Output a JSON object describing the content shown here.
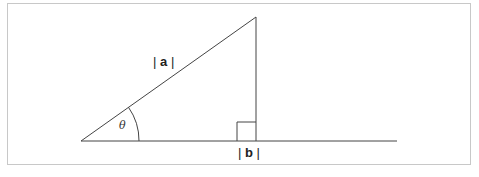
{
  "diagram": {
    "type": "right-triangle-vector-projection",
    "labels": {
      "hypotenuse": "| a |",
      "hypotenuse_bar_left": "|",
      "hypotenuse_var": "a",
      "hypotenuse_bar_right": "|",
      "base_bar_left": "|",
      "base_var": "b",
      "base_bar_right": "|",
      "angle": "θ"
    },
    "colors": {
      "line": "#333333",
      "border": "#c8c8c8"
    }
  }
}
